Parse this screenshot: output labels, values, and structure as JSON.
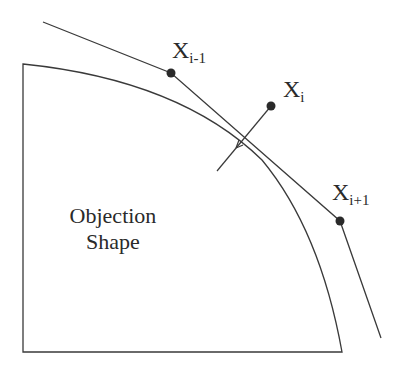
{
  "diagram": {
    "shape_label_line1": "Objection",
    "shape_label_line2": "Shape",
    "points": [
      {
        "id": "prev",
        "base": "X",
        "sub": "i-1"
      },
      {
        "id": "cur",
        "base": "X",
        "sub": "i"
      },
      {
        "id": "next",
        "base": "X",
        "sub": "i+1"
      }
    ],
    "colors": {
      "stroke": "#3a3a3a",
      "point": "#2a2a2a",
      "background": "#ffffff"
    }
  }
}
